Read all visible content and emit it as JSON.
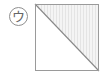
{
  "figure": {
    "title": "",
    "background_color": "#ffffff",
    "width": 104,
    "height": 76,
    "label": {
      "glyph": "ウ",
      "icon_name": "circled-katakana-u-label",
      "shape": "circle",
      "stroke_color": "#8f8f8f",
      "text_color": "#666666",
      "fill_color": "#ffffff"
    },
    "shape": {
      "name": "square-with-diagonal",
      "type": "square",
      "border_color": "#9a9a9a",
      "border_width": 1,
      "diagonal": {
        "from": "top-left",
        "to": "bottom-right",
        "color": "#888888",
        "width": 1
      },
      "regions": [
        {
          "name": "upper-right-triangle",
          "fill": "#f2f2f2",
          "pattern": "vertical-hatch",
          "pattern_color": "#e6e6e6"
        },
        {
          "name": "lower-left-triangle",
          "fill": "#ffffff",
          "pattern": "none",
          "pattern_color": "#ffffff"
        }
      ]
    }
  }
}
